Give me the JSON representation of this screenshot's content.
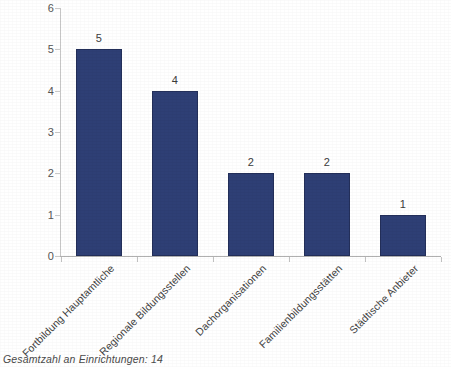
{
  "chart_data": {
    "type": "bar",
    "title": "",
    "subtitle": "",
    "xlabel": "",
    "ylabel": "",
    "categories": [
      "Fortbildung Hauptamtliche",
      "Regionale Bildungsstellen",
      "Dachorganisationen",
      "Familienbildungsstätten",
      "Städtische Anbieter"
    ],
    "values": [
      5,
      4,
      2,
      2,
      1
    ],
    "data_labels": [
      "5",
      "4",
      "2",
      "2",
      "1"
    ],
    "ylim": [
      0,
      6
    ],
    "ytick_labels": [
      "0",
      "1",
      "2",
      "3",
      "4",
      "5",
      "6"
    ],
    "ytick_values": [
      0,
      1,
      2,
      3,
      4,
      5,
      6
    ],
    "grid": false,
    "legend": false,
    "legend_position": "none",
    "annotation": "Gesamtzahl an Einrichtungen: 14",
    "bar_color": "#2e3f75",
    "bar_border_color": "#232f5a",
    "axis_color": "#b0b0b0",
    "background_color": "#ffffff",
    "text_color": "#3a3a3a"
  }
}
